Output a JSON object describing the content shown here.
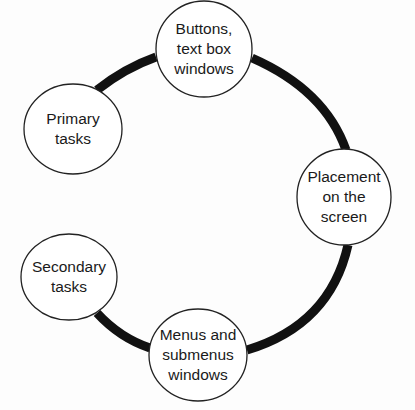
{
  "diagram": {
    "type": "cycle",
    "colors": {
      "arc": "#111111",
      "node_stroke": "#222222",
      "node_fill": "#ffffff",
      "text": "#1a1a1a"
    },
    "nodes": [
      {
        "id": "buttons",
        "label": "Buttons,\ntext box\nwindows",
        "cx": 204,
        "cy": 49,
        "rx": 48,
        "ry": 48
      },
      {
        "id": "primary",
        "label": "Primary\ntasks",
        "cx": 73,
        "cy": 129,
        "rx": 49,
        "ry": 45
      },
      {
        "id": "placement",
        "label": "Placement\non the\nscreen",
        "cx": 344,
        "cy": 197,
        "rx": 47,
        "ry": 48
      },
      {
        "id": "secondary",
        "label": "Secondary\ntasks",
        "cx": 69,
        "cy": 277,
        "rx": 48,
        "ry": 43
      },
      {
        "id": "menus",
        "label": "Menus and\nsubmenus\nwindows",
        "cx": 198,
        "cy": 355,
        "rx": 49,
        "ry": 46
      }
    ]
  }
}
